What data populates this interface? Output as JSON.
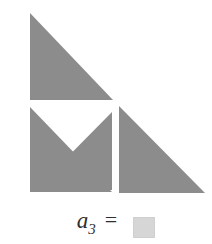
{
  "figure": {
    "fill_color": "#8c8c8c",
    "gap_color": "#ffffff",
    "background_color": "#ffffff",
    "pieces": [
      {
        "name": "top-triangle",
        "shape": "right-triangle",
        "points": "30,13 30,100 113,100"
      },
      {
        "name": "square-lower-left-triangle",
        "shape": "right-triangle",
        "points": "30,107 30,192 112,192"
      },
      {
        "name": "square-upper-right-triangle",
        "shape": "right-triangle",
        "points": "33,192 112,112 112,190"
      },
      {
        "name": "right-triangle",
        "shape": "right-triangle",
        "points": "119,106 119,193 205,193"
      }
    ]
  },
  "formula": {
    "variable": "a",
    "subscript": "3",
    "equals": "=",
    "answer_value": "",
    "answer_placeholder": ""
  }
}
